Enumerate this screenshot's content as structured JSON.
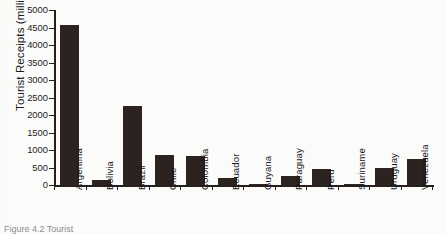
{
  "figure": {
    "caption_fragment": "Figure  4.2  Tourist"
  },
  "chart_data": {
    "type": "bar",
    "title": "",
    "xlabel": "",
    "ylabel": "Tourist Receipts (million $US)",
    "ylim": [
      0,
      5000
    ],
    "ytick_labels": [
      "0",
      "500",
      "1000",
      "1500",
      "2000",
      "2500",
      "3000",
      "3500",
      "4000",
      "4500",
      "5000"
    ],
    "ytick_values": [
      0,
      500,
      1000,
      1500,
      2000,
      2500,
      3000,
      3500,
      4000,
      4500,
      5000
    ],
    "grid": false,
    "legend": "none",
    "bar_color": "#2c2320",
    "axis_color": "#25201e",
    "categories": [
      "Argentina",
      "Bolivia",
      "Brazil",
      "Chile",
      "Colombia",
      "Ecuador",
      "Guyana",
      "Paraguay",
      "Peru",
      "Suriname",
      "Uruguay",
      "Venezuela"
    ],
    "values": [
      4570,
      140,
      2250,
      850,
      820,
      205,
      30,
      245,
      445,
      12,
      500,
      730
    ]
  }
}
